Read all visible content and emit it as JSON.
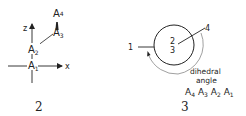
{
  "figure2": {
    "caption": "2",
    "axes": {
      "z_label": "z",
      "x_label": "x"
    },
    "atoms": [
      {
        "name": "A",
        "sub": "1"
      },
      {
        "name": "A",
        "sub": "2"
      },
      {
        "name": "A",
        "sub": "3"
      },
      {
        "name": "A",
        "sub": "4"
      }
    ]
  },
  "figure3": {
    "caption": "3",
    "center_front": "2",
    "center_back": "3",
    "atom_front_label": "4",
    "atom_back_label": "1",
    "angle_label_line1": "dihedral",
    "angle_label_line2": "angle",
    "angle_atoms": [
      {
        "name": "A",
        "sub": "4"
      },
      {
        "name": "A",
        "sub": "3"
      },
      {
        "name": "A",
        "sub": "2"
      },
      {
        "name": "A",
        "sub": "1"
      }
    ]
  },
  "colors": {
    "ink": "#222222",
    "background": "#ffffff",
    "arc": "#888888"
  }
}
